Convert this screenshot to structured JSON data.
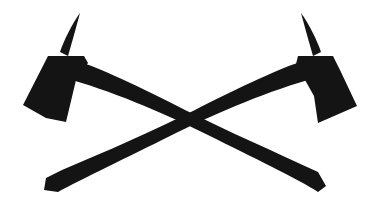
{
  "image": {
    "subject": "crossed-fire-axes",
    "description": "Black silhouette of two crossed fire axes with pick heads",
    "colors": {
      "background": "#ffffff",
      "silhouette": "#141414"
    }
  }
}
